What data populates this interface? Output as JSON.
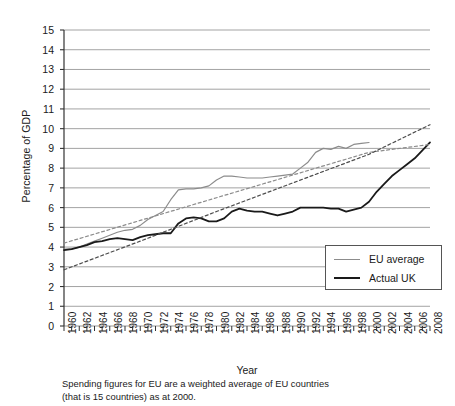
{
  "chart_data": {
    "type": "line",
    "title": "",
    "xlabel": "Year",
    "ylabel": "Percentage of GDP",
    "xlim": [
      1960,
      2008
    ],
    "ylim": [
      0,
      15
    ],
    "ytick_step": 1,
    "xtick_step": 2,
    "grid": "horizontal",
    "legend_position": "lower-right",
    "caption_line1": "Spending figures for EU are a weighted average of EU countries",
    "caption_line2": "(that is 15 countries) as at 2000.",
    "ytick_labels": [
      "0",
      "1",
      "2",
      "3",
      "4",
      "5",
      "6",
      "7",
      "8",
      "9",
      "10",
      "11",
      "12",
      "13",
      "14",
      "15"
    ],
    "xtick_labels": [
      "1960",
      "1962",
      "1964",
      "1966",
      "1968",
      "1970",
      "1972",
      "1974",
      "1976",
      "1978",
      "1980",
      "1982",
      "1984",
      "1986",
      "1988",
      "1990",
      "1992",
      "1994",
      "1996",
      "1998",
      "2000",
      "2002",
      "2004",
      "2006",
      "2008"
    ],
    "colors": {
      "eu_average": "#8c8c8c",
      "actual_uk": "#1a1a1a",
      "trend_eu": "#8c8c8c",
      "trend_uk": "#4d4d4d",
      "grid": "#999999",
      "axis": "#333333"
    },
    "series": [
      {
        "name": "EU average",
        "style": "solid",
        "color": "#8c8c8c",
        "width": 1.2,
        "x": [
          1960,
          1961,
          1962,
          1963,
          1964,
          1965,
          1966,
          1967,
          1968,
          1969,
          1970,
          1971,
          1972,
          1973,
          1974,
          1975,
          1976,
          1977,
          1978,
          1979,
          1980,
          1981,
          1982,
          1983,
          1984,
          1985,
          1986,
          1987,
          1988,
          1989,
          1990,
          1991,
          1992,
          1993,
          1994,
          1995,
          1996,
          1997,
          1998,
          1999,
          2000
        ],
        "y": [
          3.9,
          3.9,
          4.0,
          4.15,
          4.3,
          4.45,
          4.6,
          4.75,
          4.85,
          4.9,
          5.1,
          5.4,
          5.6,
          5.8,
          6.4,
          6.9,
          6.95,
          6.95,
          7.0,
          7.1,
          7.4,
          7.6,
          7.6,
          7.55,
          7.5,
          7.5,
          7.5,
          7.55,
          7.6,
          7.65,
          7.7,
          8.0,
          8.3,
          8.8,
          9.0,
          8.95,
          9.1,
          9.0,
          9.2,
          9.25,
          9.3
        ]
      },
      {
        "name": "Actual UK",
        "style": "solid",
        "color": "#1a1a1a",
        "width": 1.8,
        "x": [
          1960,
          1961,
          1962,
          1963,
          1964,
          1965,
          1966,
          1967,
          1968,
          1969,
          1970,
          1971,
          1972,
          1973,
          1974,
          1975,
          1976,
          1977,
          1978,
          1979,
          1980,
          1981,
          1982,
          1983,
          1984,
          1985,
          1986,
          1987,
          1988,
          1989,
          1990,
          1991,
          1992,
          1993,
          1994,
          1995,
          1996,
          1997,
          1998,
          1999,
          2000,
          2001,
          2002,
          2003,
          2004,
          2005,
          2006,
          2007,
          2008
        ],
        "y": [
          3.85,
          3.9,
          4.0,
          4.1,
          4.25,
          4.3,
          4.4,
          4.45,
          4.4,
          4.35,
          4.5,
          4.6,
          4.65,
          4.7,
          4.7,
          5.2,
          5.45,
          5.5,
          5.45,
          5.3,
          5.3,
          5.45,
          5.8,
          5.95,
          5.85,
          5.8,
          5.8,
          5.7,
          5.6,
          5.7,
          5.8,
          6.0,
          6.0,
          6.0,
          6.0,
          5.95,
          5.95,
          5.8,
          5.9,
          6.0,
          6.3,
          6.8,
          7.2,
          7.6,
          7.9,
          8.2,
          8.5,
          8.9,
          9.3
        ]
      },
      {
        "name": "EU average trend",
        "style": "dashed",
        "color": "#8c8c8c",
        "width": 1.2,
        "x": [
          1960,
          1970,
          1980,
          1990,
          2000,
          2008
        ],
        "y": [
          4.2,
          5.35,
          6.5,
          7.65,
          8.8,
          9.2
        ]
      },
      {
        "name": "Actual UK trend",
        "style": "dashed",
        "color": "#4d4d4d",
        "width": 1.2,
        "x": [
          1960,
          1970,
          1980,
          1990,
          2000,
          2008
        ],
        "y": [
          2.85,
          4.3,
          5.8,
          7.25,
          8.7,
          10.2
        ]
      }
    ]
  },
  "legend": {
    "items": [
      {
        "label": "EU average",
        "color": "#8c8c8c",
        "width": 1.4
      },
      {
        "label": "Actual UK",
        "color": "#1a1a1a",
        "width": 2.2
      }
    ]
  }
}
